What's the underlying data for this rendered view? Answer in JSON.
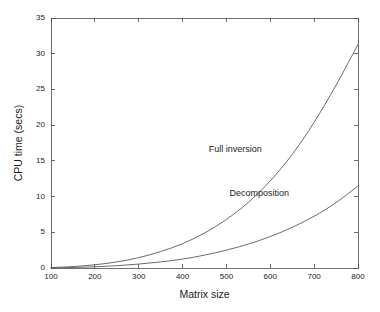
{
  "chart_data": {
    "type": "line",
    "title": "",
    "subtitle": "",
    "xlabel": "Matrix size",
    "ylabel": "CPU time (secs)",
    "xlim": [
      100,
      800
    ],
    "ylim": [
      0,
      35
    ],
    "xticks": [
      100,
      200,
      300,
      400,
      500,
      600,
      700,
      800
    ],
    "xtick_labels": [
      "100",
      "200",
      "300",
      "400",
      "500",
      "600",
      "700",
      "800"
    ],
    "yticks": [
      0,
      5,
      10,
      15,
      20,
      25,
      30,
      35
    ],
    "ytick_labels": [
      "0",
      "5",
      "10",
      "15",
      "20",
      "25",
      "30",
      "35"
    ],
    "grid": false,
    "legend_position": "inline-annotations",
    "line_color": "#5a5a5a",
    "axis_color": "#4d4d4d",
    "background_color": "#ffffff",
    "x": [
      100,
      150,
      200,
      250,
      300,
      350,
      400,
      450,
      500,
      550,
      600,
      650,
      700,
      750,
      800
    ],
    "series": [
      {
        "name": "Full inversion",
        "label_x": 520,
        "label_y": 16.6,
        "values": [
          0.06,
          0.2,
          0.45,
          0.85,
          1.45,
          2.3,
          3.4,
          4.9,
          6.8,
          9.2,
          12.2,
          15.9,
          20.4,
          25.6,
          31.3
        ]
      },
      {
        "name": "Decomposition",
        "label_x": 575,
        "label_y": 10.5,
        "values": [
          0.02,
          0.07,
          0.17,
          0.32,
          0.55,
          0.85,
          1.25,
          1.8,
          2.5,
          3.35,
          4.4,
          5.7,
          7.25,
          9.15,
          11.5
        ]
      }
    ],
    "annotations": [
      {
        "text": "Full inversion"
      },
      {
        "text": "Decomposition"
      }
    ]
  }
}
